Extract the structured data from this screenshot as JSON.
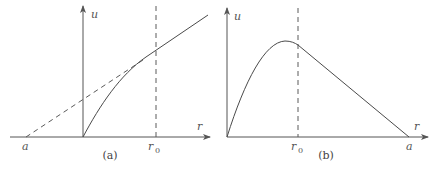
{
  "panels": [
    {
      "id": "a",
      "caption": "(a)",
      "labels": {
        "y_axis": "u",
        "x_axis": "r",
        "r0_main": "r",
        "r0_sub": "0",
        "a": "a"
      },
      "description": "u rises from origin along a concave curve, then continues linearly beyond r0; dashed tangent line extended back to r = a on the negative r-axis"
    },
    {
      "id": "b",
      "caption": "(b)",
      "labels": {
        "y_axis": "u",
        "x_axis": "r",
        "r0_main": "r",
        "r0_sub": "0",
        "a": "a"
      },
      "description": "u rises from origin to a peak just before r0, then decreases linearly to zero at r = a"
    }
  ]
}
